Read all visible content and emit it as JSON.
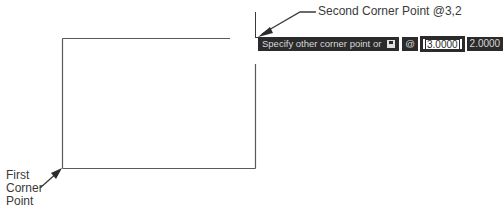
{
  "annotations": {
    "second_corner": "Second Corner Point @3,2",
    "first_corner_lines": [
      "First",
      "Corner",
      "Point"
    ]
  },
  "command_prompt": {
    "text": "Specify other corner point or",
    "dropdown_icon": "down-arrow-icon",
    "relative_symbol": "@",
    "x_value": "3.0000",
    "y_value": "2.0000"
  },
  "drawing": {
    "shape": "rectangle",
    "line_color": "#555555",
    "prompt_bg": "#2b2b2b"
  }
}
